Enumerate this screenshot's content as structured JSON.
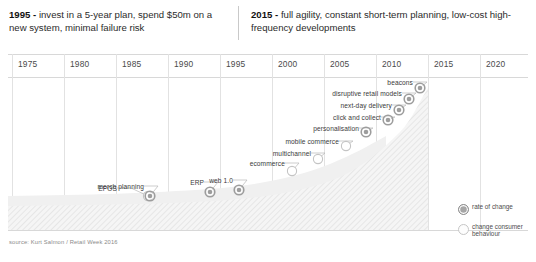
{
  "header": {
    "left": {
      "year": "1995 - ",
      "text": "invest in a 5-year plan, spend $50m on a new system, minimal failure risk"
    },
    "right": {
      "year": "2015 - ",
      "text": "full agility, constant short-term planning, low-cost high-frequency developments"
    }
  },
  "axis": {
    "years": [
      "1975",
      "1980",
      "1985",
      "1990",
      "1995",
      "2000",
      "2005",
      "2010",
      "2015",
      "2020"
    ]
  },
  "legend": {
    "items": [
      {
        "key": "rate-of-change",
        "label": "rate of change",
        "style": "dark",
        "color": "#9d9d9d"
      },
      {
        "key": "change-consumer-behaviour",
        "label": "change consumer behaviour",
        "style": "light",
        "color": "#cfcfcf"
      }
    ]
  },
  "source": "source: Kurt Salmon / Retail Week 2016",
  "chart_data": {
    "type": "scatter",
    "title": "",
    "xlabel": "",
    "ylabel": "",
    "xlim": [
      1975,
      2020
    ],
    "grid": true,
    "legend_position": "bottom-right",
    "series": [
      {
        "name": "change consumer behaviour",
        "marker": "hollow",
        "color": "#cfcfcf",
        "points": [
          {
            "label": "EPOS",
            "x": 1988,
            "y": 0.11,
            "px": 148,
            "py": 196,
            "lx": 117,
            "ly": 188
          },
          {
            "label": "ecommerce",
            "x": 2001,
            "y": 0.3,
            "px": 292,
            "py": 171,
            "lx": 285,
            "ly": 163
          },
          {
            "label": "multichannel",
            "x": 2004,
            "y": 0.4,
            "px": 318,
            "py": 159,
            "lx": 311,
            "ly": 153
          },
          {
            "label": "mobile commerce",
            "x": 2007,
            "y": 0.52,
            "px": 346,
            "py": 146,
            "lx": 339,
            "ly": 141
          }
        ]
      },
      {
        "name": "rate of change",
        "marker": "ringed",
        "color": "#9d9d9d",
        "points": [
          {
            "label": "merch planning",
            "x": 1989,
            "y": 0.12,
            "px": 150,
            "py": 196,
            "lx": 144,
            "ly": 186
          },
          {
            "label": "ERP",
            "x": 1996,
            "y": 0.16,
            "px": 210,
            "py": 192,
            "lx": 204,
            "ly": 182
          },
          {
            "label": "web 1.0",
            "x": 1999,
            "y": 0.2,
            "px": 239,
            "py": 190,
            "lx": 233,
            "ly": 180
          },
          {
            "label": "personalisation",
            "x": 2009,
            "y": 0.62,
            "px": 366,
            "py": 132,
            "lx": 359,
            "ly": 128
          },
          {
            "label": "click and collect",
            "x": 2011,
            "y": 0.72,
            "px": 388,
            "py": 120,
            "lx": 381,
            "ly": 117
          },
          {
            "label": "next-day delivery",
            "x": 2012,
            "y": 0.8,
            "px": 399,
            "py": 110,
            "lx": 392,
            "ly": 105
          },
          {
            "label": "disruptive retail models",
            "x": 2013,
            "y": 0.88,
            "px": 409,
            "py": 99,
            "lx": 402,
            "ly": 93
          },
          {
            "label": "beacons",
            "x": 2015,
            "y": 0.95,
            "px": 420,
            "py": 88,
            "lx": 413,
            "ly": 82
          }
        ]
      }
    ]
  }
}
